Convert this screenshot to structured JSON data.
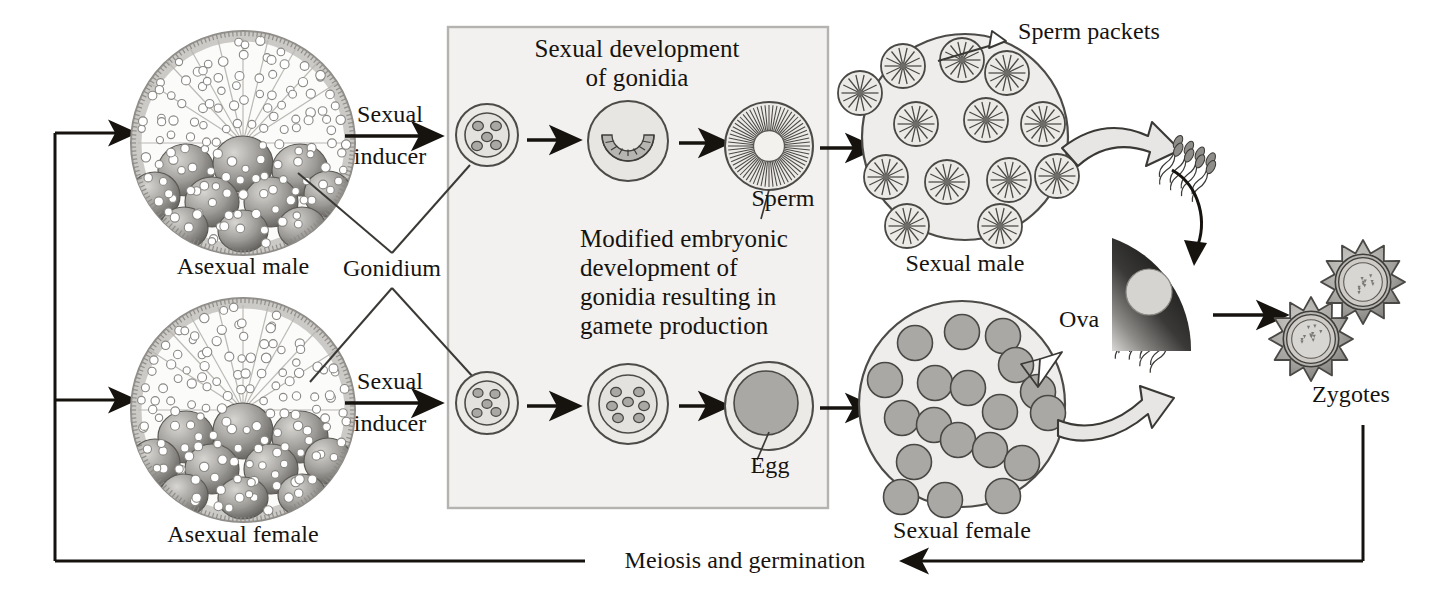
{
  "diagram": {
    "background_color": "#ffffff",
    "ink_color": "#16130f",
    "box_fill": "#f2f1ef",
    "box_stroke": "#b3b1ae",
    "spheroid_fill": "#f0efed",
    "spheroid_stroke": "#5d5b58",
    "cell_fill": "#a9a8a5",
    "cell_stroke": "#4a4845"
  },
  "labels": {
    "asexual_male": "Asexual male",
    "asexual_female": "Asexual female",
    "sexual_inducer_top": "Sexual\ninducer",
    "sexual_inducer_bottom": "Sexual\ninducer",
    "gonidium": "Gonidium",
    "sexual_development": "Sexual development\nof gonidia",
    "modified_embryonic": "Modified embryonic\ndevelopment of\ngonidia resulting in\ngamete production",
    "sperm": "Sperm",
    "egg": "Egg",
    "sperm_packets": "Sperm packets",
    "sexual_male": "Sexual male",
    "ova": "Ova",
    "sexual_female": "Sexual female",
    "zygotes": "Zygotes",
    "meiosis": "Meiosis and germination"
  },
  "label_lines": {
    "sexual_inducer_top": [
      "Sexual",
      "inducer"
    ],
    "sexual_inducer_bottom": [
      "Sexual",
      "inducer"
    ],
    "sexual_development": [
      "Sexual development",
      "of gonidia"
    ],
    "modified_embryonic": [
      "Modified embryonic",
      "development of",
      "gonidia resulting in",
      "gamete production"
    ]
  },
  "nodes": [
    {
      "name": "asexual-male-spheroid",
      "kind": "asexual-colony",
      "cx": 243,
      "cy": 143,
      "r": 113,
      "label": "Asexual male"
    },
    {
      "name": "asexual-female-spheroid",
      "kind": "asexual-colony",
      "cx": 243,
      "cy": 410,
      "r": 113,
      "label": "Asexual female"
    },
    {
      "name": "gonidium-male-stage1",
      "kind": "gonidium",
      "cx": 487,
      "cy": 135,
      "r": 31,
      "inner_cells": 5
    },
    {
      "name": "gonidium-male-stage2",
      "kind": "cleaving",
      "cx": 628,
      "cy": 141,
      "r": 40
    },
    {
      "name": "gonidium-male-stage3",
      "kind": "sperm-packet",
      "cx": 769,
      "cy": 146,
      "r": 44
    },
    {
      "name": "gonidium-female-stage1",
      "kind": "gonidium",
      "cx": 487,
      "cy": 403,
      "r": 31,
      "inner_cells": 5
    },
    {
      "name": "gonidium-female-stage2",
      "kind": "gonidium",
      "cx": 628,
      "cy": 404,
      "r": 40,
      "inner_cells": 7
    },
    {
      "name": "gonidium-female-stage3",
      "kind": "egg",
      "cx": 769,
      "cy": 406,
      "r": 44
    },
    {
      "name": "sexual-male-spheroid",
      "kind": "sexual-male",
      "cx": 965,
      "cy": 137,
      "r": 103,
      "label": "Sexual male",
      "packets": 13
    },
    {
      "name": "sexual-female-spheroid",
      "kind": "sexual-female",
      "cx": 962,
      "cy": 404,
      "r": 103,
      "label": "Sexual female",
      "ova": 19
    },
    {
      "name": "fertilization-wedge",
      "kind": "wedge",
      "cx": 1135,
      "cy": 340,
      "label": ""
    },
    {
      "name": "zygote-upper",
      "kind": "zygote",
      "cx": 1363,
      "cy": 282,
      "r": 40
    },
    {
      "name": "zygote-lower",
      "kind": "zygote",
      "cx": 1311,
      "cy": 339,
      "r": 40
    }
  ],
  "flows": [
    {
      "name": "arrow-inducer-male",
      "label": "Sexual inducer",
      "from": "asexual-male-spheroid",
      "to": "gonidium-male-stage1"
    },
    {
      "name": "arrow-inducer-female",
      "label": "Sexual inducer",
      "from": "asexual-female-spheroid",
      "to": "gonidium-female-stage1"
    },
    {
      "name": "arrow-male-1",
      "label": "",
      "from": "gonidium-male-stage1",
      "to": "gonidium-male-stage2"
    },
    {
      "name": "arrow-male-2",
      "label": "",
      "from": "gonidium-male-stage2",
      "to": "gonidium-male-stage3"
    },
    {
      "name": "arrow-male-3",
      "label": "",
      "from": "gonidium-male-stage3",
      "to": "sexual-male-spheroid"
    },
    {
      "name": "arrow-female-1",
      "label": "",
      "from": "gonidium-female-stage1",
      "to": "gonidium-female-stage2"
    },
    {
      "name": "arrow-female-2",
      "label": "",
      "from": "gonidium-female-stage2",
      "to": "gonidium-female-stage3"
    },
    {
      "name": "arrow-female-3",
      "label": "",
      "from": "gonidium-female-stage3",
      "to": "sexual-female-spheroid"
    },
    {
      "name": "arrow-sperm-release",
      "label": "",
      "from": "sexual-male-spheroid",
      "to": "sperm-bundle"
    },
    {
      "name": "arrow-sperm-to-egg",
      "label": "",
      "from": "sperm-bundle",
      "to": "fertilization-wedge"
    },
    {
      "name": "arrow-ova-release",
      "label": "",
      "from": "sexual-female-spheroid",
      "to": "fertilization-wedge"
    },
    {
      "name": "arrow-to-zygotes",
      "label": "",
      "from": "fertilization-wedge",
      "to": "zygote-lower"
    },
    {
      "name": "arrow-meiosis-return",
      "label": "Meiosis and germination",
      "from": "zygotes",
      "to": "asexual-colonies"
    }
  ]
}
